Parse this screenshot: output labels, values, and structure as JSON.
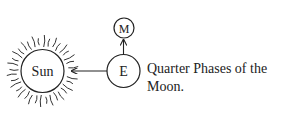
{
  "diagram": {
    "sun_label": "Sun",
    "earth_label": "E",
    "moon_label": "M",
    "caption": "Quarter Phases of the Moon.",
    "caption_line1": "Quarter Phases of the",
    "caption_line2": "Moon.",
    "stroke_color": "#222222"
  }
}
